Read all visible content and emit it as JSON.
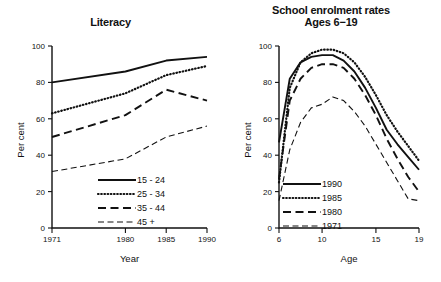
{
  "chart_data": [
    {
      "type": "line",
      "id": "literacy",
      "title": "Literacy",
      "xlabel": "Year",
      "ylabel": "Per cent",
      "x": [
        1971,
        1980,
        1985,
        1990
      ],
      "xticks": [
        "1971",
        "1980",
        "1985",
        "1990"
      ],
      "yticks": [
        "0",
        "20",
        "40",
        "60",
        "80",
        "100"
      ],
      "xlim": [
        1971,
        1990
      ],
      "ylim": [
        0,
        100
      ],
      "grid": false,
      "legend_position": "bottom-right",
      "series": [
        {
          "name": "15 - 24",
          "style": "solid",
          "values": [
            80,
            86,
            92,
            94
          ]
        },
        {
          "name": "25 - 34",
          "style": "dotted",
          "values": [
            63,
            74,
            84,
            89
          ]
        },
        {
          "name": "35 - 44",
          "style": "dashed",
          "values": [
            50,
            62,
            76,
            70
          ]
        },
        {
          "name": "45 +",
          "style": "fine",
          "values": [
            31,
            38,
            50,
            56
          ]
        }
      ]
    },
    {
      "type": "line",
      "id": "enrolment",
      "title": "School enrolment rates",
      "subtitle": "Ages 6−19",
      "xlabel": "Age",
      "ylabel": "Per cent",
      "xticks": [
        "6",
        "10",
        "15",
        "19"
      ],
      "yticks": [
        "0",
        "20",
        "40",
        "60",
        "80",
        "100"
      ],
      "xlim": [
        6,
        19
      ],
      "ylim": [
        0,
        100
      ],
      "grid": false,
      "legend_position": "bottom-left",
      "x": [
        6,
        7,
        8,
        9,
        10,
        11,
        12,
        13,
        14,
        15,
        16,
        17,
        18,
        19
      ],
      "series": [
        {
          "name": "1990",
          "style": "solid",
          "values": [
            47,
            82,
            91,
            94,
            95,
            95,
            92,
            86,
            77,
            66,
            54,
            46,
            39,
            32
          ]
        },
        {
          "name": "1985",
          "style": "dotted",
          "values": [
            25,
            77,
            91,
            96,
            98,
            98,
            96,
            91,
            83,
            73,
            62,
            53,
            45,
            37
          ]
        },
        {
          "name": "1980",
          "style": "dashed",
          "values": [
            27,
            70,
            82,
            88,
            90,
            90,
            88,
            82,
            73,
            62,
            49,
            38,
            28,
            20
          ]
        },
        {
          "name": "1971",
          "style": "fine",
          "values": [
            15,
            43,
            58,
            66,
            68,
            72,
            70,
            64,
            56,
            46,
            36,
            26,
            16,
            15
          ]
        }
      ]
    }
  ]
}
